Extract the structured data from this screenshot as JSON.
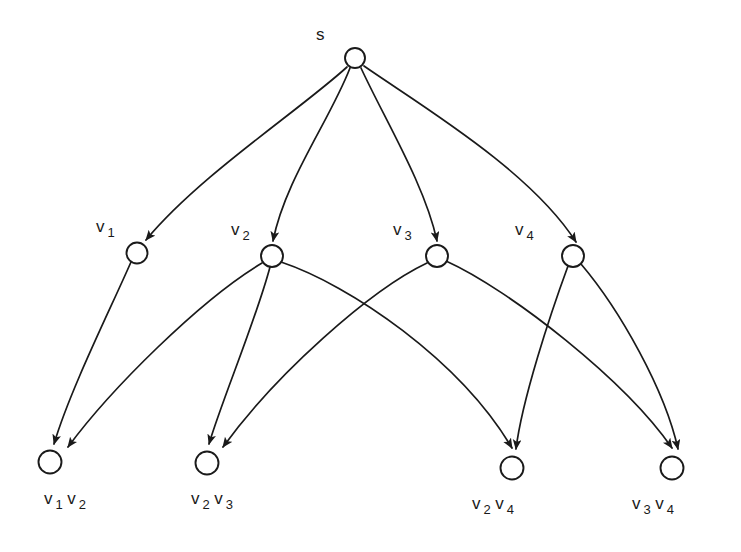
{
  "diagram": {
    "title": "",
    "background_color": "#ffffff",
    "stroke_color": "#1a1a1a",
    "width": 741,
    "height": 552,
    "type": "directed-acyclic-graph-lattice"
  },
  "nodes": [
    {
      "id": "s",
      "label": "s",
      "label_html": "s",
      "x": 355,
      "y": 58,
      "r": 10,
      "level": 0,
      "label_x": 316,
      "label_y": 26
    },
    {
      "id": "v1",
      "label": "v 1",
      "label_html": "v<sub>1</sub>",
      "x": 137,
      "y": 253,
      "r": 10.5,
      "level": 1,
      "label_x": 96,
      "label_y": 218
    },
    {
      "id": "v2",
      "label": "v 2",
      "label_html": "v<sub>2</sub>",
      "x": 272,
      "y": 256,
      "r": 11,
      "level": 1,
      "label_x": 231,
      "label_y": 221
    },
    {
      "id": "v3",
      "label": "v 3",
      "label_html": "v<sub>3</sub>",
      "x": 437,
      "y": 256,
      "r": 11,
      "level": 1,
      "label_x": 393,
      "label_y": 221
    },
    {
      "id": "v4",
      "label": "v 4",
      "label_html": "v<sub>4</sub>",
      "x": 573,
      "y": 256,
      "r": 11,
      "level": 1,
      "label_x": 515,
      "label_y": 221
    },
    {
      "id": "v1v2",
      "label": "v 1 v 2",
      "label_html": "v<sub>1</sub>v<sub>2</sub>",
      "x": 50,
      "y": 462,
      "r": 11.5,
      "level": 2,
      "label_x": 44,
      "label_y": 490
    },
    {
      "id": "v2v3",
      "label": "v 2 v 3",
      "label_html": "v<sub>2</sub>v<sub>3</sub>",
      "x": 207,
      "y": 463,
      "r": 11.5,
      "level": 2,
      "label_x": 191,
      "label_y": 490
    },
    {
      "id": "v2v4",
      "label": "v 2 v 4",
      "label_html": "v<sub>2</sub>v<sub>4</sub>",
      "x": 512,
      "y": 468,
      "r": 11.5,
      "level": 2,
      "label_x": 472,
      "label_y": 495
    },
    {
      "id": "v3v4",
      "label": "v 3 v 4",
      "label_html": "v<sub>3</sub>v<sub>4</sub>",
      "x": 672,
      "y": 468,
      "r": 11.5,
      "level": 2,
      "label_x": 632,
      "label_y": 495
    }
  ],
  "edges": [
    {
      "from": "s",
      "to": "v1",
      "path": "M 347 67 C 300 110 200 175 146 240",
      "arrow": true
    },
    {
      "from": "s",
      "to": "v2",
      "path": "M 350 68 C 330 120 285 180 273 241",
      "arrow": true
    },
    {
      "from": "s",
      "to": "v3",
      "path": "M 361 68 C 385 120 425 185 437 241",
      "arrow": true
    },
    {
      "from": "s",
      "to": "v4",
      "path": "M 364 66 C 420 105 530 170 576 242",
      "arrow": true
    },
    {
      "from": "v1",
      "to": "v1v2",
      "path": "M 131 262 C 110 310 70 390 54 444",
      "arrow": true
    },
    {
      "from": "v2",
      "to": "v1v2",
      "path": "M 262 263 C 200 300 110 390 68 447",
      "arrow": true
    },
    {
      "from": "v2",
      "to": "v2v3",
      "path": "M 270 267 C 256 320 222 400 209 444",
      "arrow": true
    },
    {
      "from": "v2",
      "to": "v2v4",
      "path": "M 281 262 C 350 285 460 360 512 448",
      "arrow": true
    },
    {
      "from": "v3",
      "to": "v2v3",
      "path": "M 427 263 C 370 290 275 375 223 447",
      "arrow": true
    },
    {
      "from": "v3",
      "to": "v3v4",
      "path": "M 446 261 C 510 290 625 380 672 448",
      "arrow": true
    },
    {
      "from": "v4",
      "to": "v2v4",
      "path": "M 568 266 C 550 315 522 400 516 449",
      "arrow": true
    },
    {
      "from": "v4",
      "to": "v3v4",
      "path": "M 581 264 C 620 310 665 390 678 449",
      "arrow": true
    }
  ]
}
